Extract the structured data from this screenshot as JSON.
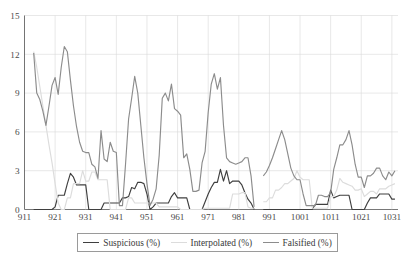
{
  "chart_data": {
    "type": "line",
    "title": "",
    "xlabel": "",
    "ylabel": "",
    "xlim": [
      911,
      1033
    ],
    "ylim": [
      0,
      15
    ],
    "grid": true,
    "legend_position": "bottom",
    "y_ticks": [
      0,
      3,
      6,
      9,
      12,
      15
    ],
    "x_ticks": [
      911,
      921,
      931,
      941,
      951,
      961,
      971,
      981,
      991,
      1001,
      1011,
      1021,
      1031
    ],
    "y_tick_labels": [
      "0",
      "3",
      "6",
      "9",
      "12",
      "15"
    ],
    "x_tick_labels": [
      "911",
      "921",
      "931",
      "941",
      "951",
      "961",
      "971",
      "981",
      "991",
      "1001",
      "1011",
      "1021",
      "1031"
    ],
    "colors": {
      "suspicious": "#3f3f3f",
      "interpolated": "#dcdcdc",
      "falsified": "#8c8c8c",
      "gridline": "#d9d9d9",
      "axis": "#555555",
      "background": "#ffffff"
    },
    "series": [
      {
        "name": "Suspicious (%)",
        "color": "#3f3f3f",
        "stroke_width": 1.15,
        "x": [
          914,
          915,
          916,
          917,
          918,
          919,
          920,
          921,
          922,
          923,
          924,
          925,
          926,
          927,
          928,
          929,
          930,
          931,
          932,
          933,
          934,
          935,
          936,
          937,
          938,
          939,
          940,
          941,
          942,
          943,
          944,
          945,
          946,
          947,
          948,
          949,
          950,
          951,
          952,
          953,
          954,
          955,
          956,
          957,
          958,
          959,
          960,
          961,
          962,
          963,
          964,
          965,
          966,
          967,
          968,
          969,
          970,
          971,
          972,
          973,
          974,
          975,
          976,
          977,
          978,
          979,
          980,
          981,
          982,
          983,
          984,
          985,
          986
        ],
        "values": [
          0,
          0,
          0,
          0,
          0,
          0,
          0,
          0.2,
          1.1,
          1.1,
          1.1,
          2.0,
          2.8,
          2.5,
          1.9,
          1.9,
          1.9,
          1.9,
          0,
          0,
          0,
          0,
          0,
          0.5,
          0.5,
          0.5,
          0.5,
          0.5,
          0.5,
          0.9,
          0.9,
          1.0,
          1.7,
          1.6,
          2.1,
          2.1,
          2.0,
          1.2,
          0,
          0.2,
          0.5,
          0.5,
          0.5,
          0.5,
          0.5,
          1.0,
          1.3,
          0.9,
          0.9,
          0.9,
          0.9,
          0,
          0,
          0,
          0,
          0,
          0.6,
          1.2,
          1.7,
          2.1,
          2.1,
          3.1,
          2.2,
          3.0,
          2.0,
          2.2,
          2.2,
          2.2,
          1.9,
          1.3,
          0.8,
          0.5,
          0
        ],
        "x2": [
          989,
          990,
          991,
          992,
          993,
          994,
          995,
          996,
          997,
          998,
          999,
          1000,
          1001,
          1002,
          1003,
          1004,
          1005,
          1006,
          1007,
          1008,
          1009,
          1010,
          1011,
          1012,
          1013,
          1014,
          1015,
          1016,
          1017,
          1018,
          1019,
          1020,
          1021,
          1022,
          1023,
          1024,
          1025,
          1026,
          1027,
          1028,
          1029,
          1030,
          1031,
          1032
        ],
        "values2": [
          0,
          0,
          0,
          0,
          0,
          0,
          0,
          0,
          0,
          0,
          0,
          0,
          0,
          0,
          0,
          0,
          0,
          0.4,
          0.4,
          0.4,
          0.4,
          0.4,
          1.5,
          0.9,
          1.0,
          1.1,
          1.1,
          1.1,
          1.1,
          0,
          0,
          0,
          0,
          0,
          0.5,
          0.9,
          0.9,
          0.9,
          1.2,
          1.2,
          1.2,
          1.2,
          0.8,
          0.8
        ]
      },
      {
        "name": "Interpolated (%)",
        "color": "#dcdcdc",
        "stroke_width": 1.15,
        "x": [
          914,
          915,
          916,
          917,
          918,
          919,
          920,
          921,
          922,
          923,
          924,
          925,
          926,
          927,
          928,
          929,
          930,
          931,
          932,
          933,
          934,
          935,
          936,
          937,
          938,
          939,
          940,
          941,
          942,
          943,
          944,
          945,
          946,
          947,
          948,
          949,
          950,
          951,
          952,
          953,
          954,
          955,
          956,
          957,
          958,
          959,
          960,
          961,
          962,
          963,
          964,
          965,
          966,
          967,
          968,
          969,
          970,
          971,
          972,
          973,
          974,
          975,
          976,
          977,
          978,
          979,
          980,
          981,
          982,
          983,
          984,
          985,
          986
        ],
        "values": [
          12.2,
          11.0,
          9.5,
          8.0,
          6.5,
          5.0,
          3.6,
          2.0,
          0.5,
          0,
          0,
          0.9,
          0.9,
          2.0,
          2.0,
          2.0,
          3.0,
          2.2,
          2.2,
          2.9,
          2.9,
          2.3,
          2.3,
          2.3,
          2.3,
          0,
          0,
          0,
          0,
          0,
          0,
          0.9,
          0.9,
          0.5,
          0.5,
          0.5,
          0.5,
          0.5,
          0.5,
          0.5,
          0.5,
          0.2,
          0.2,
          0.2,
          0.2,
          0.2,
          0.2,
          0.2,
          0,
          0,
          0,
          0,
          0,
          0,
          0,
          0,
          0.1,
          0.1,
          0.1,
          0.1,
          0.1,
          0.1,
          0.1,
          0.1,
          0.1,
          1.2,
          1.2,
          1.2,
          1.3,
          1.3,
          0.2,
          0.1,
          0.1
        ],
        "x2": [
          989,
          990,
          991,
          992,
          993,
          994,
          995,
          996,
          997,
          998,
          999,
          1000,
          1001,
          1002,
          1003,
          1004,
          1005,
          1006,
          1007,
          1008,
          1009,
          1010,
          1011,
          1012,
          1013,
          1014,
          1015,
          1016,
          1017,
          1018,
          1019,
          1020,
          1021,
          1022,
          1023,
          1024,
          1025,
          1026,
          1027,
          1028,
          1029,
          1030,
          1031,
          1032
        ],
        "values2": [
          0.6,
          0.6,
          0.9,
          0.9,
          1.5,
          1.5,
          1.7,
          2.0,
          2.0,
          2.2,
          2.4,
          3.0,
          2.5,
          2.3,
          2.3,
          2.3,
          0.1,
          0.1,
          0.1,
          0.1,
          0.1,
          0.1,
          1.0,
          1.0,
          1.5,
          2.4,
          2.1,
          2.0,
          1.9,
          1.8,
          1.5,
          1.5,
          1.6,
          1.0,
          1.2,
          1.4,
          1.4,
          1.2,
          1.6,
          1.6,
          1.6,
          1.8,
          1.9,
          2.0
        ]
      },
      {
        "name": "Falsified (%)",
        "color": "#8c8c8c",
        "stroke_width": 1.15,
        "x": [
          914,
          915,
          916,
          917,
          918,
          919,
          920,
          921,
          922,
          923,
          924,
          925,
          926,
          927,
          928,
          929,
          930,
          931,
          932,
          933,
          934,
          935,
          936,
          937,
          938,
          939,
          940,
          941,
          942,
          943,
          944,
          945,
          946,
          947,
          948,
          949,
          950,
          951,
          952,
          953,
          954,
          955,
          956,
          957,
          958,
          959,
          960,
          961,
          962,
          963,
          964,
          965,
          966,
          967,
          968,
          969,
          970,
          971,
          972,
          973,
          974,
          975,
          976,
          977,
          978,
          979,
          980,
          981,
          982,
          983,
          984,
          985,
          986
        ],
        "values": [
          12.1,
          9.0,
          8.5,
          7.6,
          6.5,
          8.0,
          9.6,
          10.2,
          8.9,
          11.0,
          12.6,
          12.2,
          10.0,
          8.0,
          6.4,
          5.2,
          4.5,
          4.4,
          4.4,
          3.5,
          3.3,
          2.4,
          6.1,
          3.9,
          3.7,
          5.2,
          4.5,
          4.4,
          0.3,
          0.3,
          3.5,
          7.0,
          8.6,
          10.3,
          9.0,
          6.5,
          4.0,
          2.0,
          0.3,
          0.8,
          1.6,
          4.2,
          8.6,
          9.0,
          8.4,
          9.7,
          7.8,
          7.6,
          7.3,
          4.0,
          4.3,
          3.1,
          1.4,
          1.4,
          1.5,
          3.6,
          4.5,
          7.5,
          9.7,
          10.5,
          9.3,
          10.2,
          6.5,
          4.0,
          3.7,
          3.6,
          3.5,
          3.6,
          3.7,
          4.0,
          4.0,
          2.6,
          0.2
        ],
        "x2": [
          989,
          990,
          991,
          992,
          993,
          994,
          995,
          996,
          997,
          998,
          999,
          1000,
          1001,
          1002,
          1003,
          1004,
          1005,
          1006,
          1007,
          1008,
          1009,
          1010,
          1011,
          1012,
          1013,
          1014,
          1015,
          1016,
          1017,
          1018,
          1019,
          1020,
          1021,
          1022,
          1023,
          1024,
          1025,
          1026,
          1027,
          1028,
          1029,
          1030,
          1031,
          1032
        ],
        "values2": [
          2.6,
          2.9,
          3.4,
          4.0,
          4.7,
          5.4,
          6.1,
          5.4,
          4.3,
          3.2,
          2.6,
          2.3,
          2.3,
          1.2,
          0.3,
          0.3,
          0.3,
          0.3,
          1.1,
          1.1,
          1.0,
          1.0,
          1.3,
          3.1,
          4.0,
          5.0,
          5.0,
          5.4,
          6.1,
          5.0,
          3.5,
          2.5,
          2.5,
          1.7,
          2.6,
          2.6,
          2.8,
          3.2,
          3.2,
          2.6,
          2.3,
          2.9,
          2.6,
          3.0
        ]
      }
    ]
  },
  "legend": {
    "entries": [
      {
        "label": "Suspicious (%)",
        "color": "#3f3f3f"
      },
      {
        "label": "Interpolated (%)",
        "color": "#dcdcdc"
      },
      {
        "label": "Falsified (%)",
        "color": "#8c8c8c"
      }
    ]
  }
}
